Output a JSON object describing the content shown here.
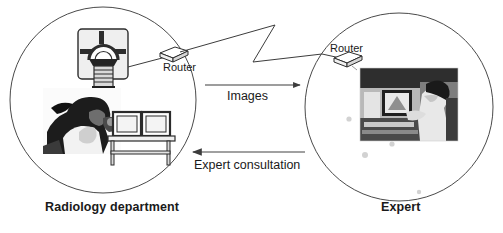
{
  "diagram": {
    "title_alt": "Teleradiology network diagram",
    "sites": [
      {
        "id": "radiology",
        "label": "Radiology department",
        "side": "left",
        "devices": [
          {
            "name": "ct-scanner",
            "label": ""
          },
          {
            "name": "router",
            "label": "Router"
          },
          {
            "name": "radiographer-photo",
            "label": ""
          },
          {
            "name": "reading-workstation-monitors",
            "label": ""
          }
        ]
      },
      {
        "id": "expert",
        "label": "Expert",
        "side": "right",
        "devices": [
          {
            "name": "router",
            "label": "Router"
          },
          {
            "name": "expert-workstation-photo",
            "label": ""
          }
        ]
      }
    ],
    "flows": [
      {
        "id": "images",
        "label": "Images",
        "direction": "left-to-right"
      },
      {
        "id": "consultation",
        "label": "Expert consultation",
        "direction": "right-to-left"
      }
    ],
    "link": {
      "name": "network-link",
      "style": "zigzag"
    },
    "colors": {
      "background": "#ffffff",
      "stroke": "#3c3c3c",
      "text": "#1a1a1a",
      "photo_dark": "#2b2b2b",
      "photo_mid": "#8d8d8d",
      "photo_light": "#d8d8d8",
      "device_fill": "#e9e9e9",
      "device_dark": "#2d2d2d",
      "dot": "#d4d4d4"
    }
  }
}
